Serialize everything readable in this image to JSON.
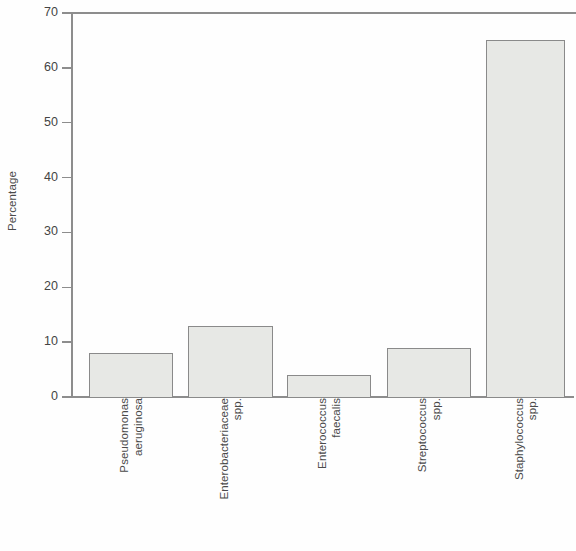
{
  "chart_data": {
    "type": "bar",
    "title": "",
    "subtitle": "",
    "xlabel": "",
    "ylabel": "Percentage",
    "ylim": [
      0,
      70
    ],
    "yticks": [
      0,
      10,
      20,
      30,
      40,
      50,
      60,
      70
    ],
    "ytick_labels": [
      "0",
      "10",
      "20",
      "30",
      "40",
      "50",
      "60",
      "70"
    ],
    "grid": false,
    "legend": null,
    "categories": [
      "Pseudomonas aeruginosa",
      "Enterobacteriaceae spp.",
      "Enterococcus faecalis",
      "Streptococcus spp.",
      "Staphylococcus spp."
    ],
    "category_lines": [
      [
        "Pseudomonas",
        "aeruginosa"
      ],
      [
        "Enterobacteriaceae",
        "spp."
      ],
      [
        "Enterococcus",
        "faecalis"
      ],
      [
        "Streptococcus",
        "spp."
      ],
      [
        "Staphylococcus",
        "spp."
      ]
    ],
    "values": [
      8,
      13,
      4,
      9,
      65
    ],
    "bar_fill_color": "#e7e8e5",
    "bar_edge_color": "#8a8a8a",
    "axis_color": "#8d8d8d",
    "text_color": "#4a4a4a"
  }
}
